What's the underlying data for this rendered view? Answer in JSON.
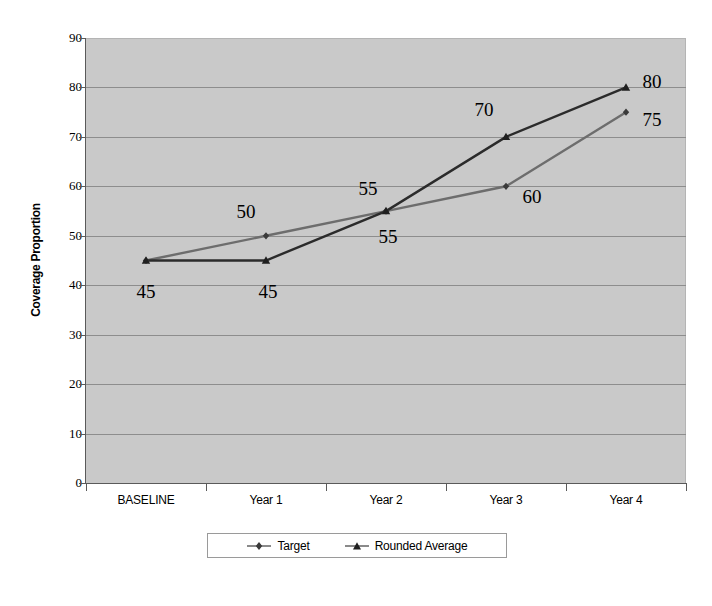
{
  "chart_data": {
    "type": "line",
    "title": "",
    "xlabel": "",
    "ylabel": "Coverage  Proportion",
    "categories": [
      "BASELINE",
      "Year 1",
      "Year 2",
      "Year 3",
      "Year 4"
    ],
    "series": [
      {
        "name": "Target",
        "color": "#6d6d6d",
        "marker": "diamond",
        "values": [
          45,
          50,
          55,
          60,
          75
        ],
        "labels": [
          "45",
          "50",
          "55",
          "60",
          "75"
        ]
      },
      {
        "name": "Rounded Average",
        "color": "#2b2b2b",
        "marker": "triangle",
        "values": [
          45,
          45,
          55,
          70,
          80
        ],
        "labels": [
          "45",
          "45",
          "55",
          "70",
          "80"
        ]
      }
    ],
    "ylim": [
      0,
      90
    ],
    "ytick_labels": [
      "90",
      "80",
      "70",
      "60",
      "50",
      "40",
      "30",
      "20",
      "10",
      "0"
    ],
    "ytick_values": [
      90,
      80,
      70,
      60,
      50,
      40,
      30,
      20,
      10,
      0
    ],
    "grid": true,
    "legend_position": "bottom",
    "plot_background": "#c9c9c9",
    "gridline_color": "#8d8d8d",
    "axis_color": "#5a5a5a",
    "annotations": [
      {
        "text": "45",
        "series": "Rounded Average",
        "category": "BASELINE",
        "value": 45
      },
      {
        "text": "45",
        "series": "Rounded Average",
        "category": "Year 1",
        "value": 45
      },
      {
        "text": "50",
        "series": "Target",
        "category": "Year 1",
        "value": 50
      },
      {
        "text": "55",
        "series": "Rounded Average",
        "category": "Year 2",
        "value": 55
      },
      {
        "text": "55",
        "series": "Target",
        "category": "Year 2",
        "value": 55
      },
      {
        "text": "70",
        "series": "Rounded Average",
        "category": "Year 3",
        "value": 70
      },
      {
        "text": "60",
        "series": "Target",
        "category": "Year 3",
        "value": 60
      },
      {
        "text": "80",
        "series": "Rounded Average",
        "category": "Year 4",
        "value": 80
      },
      {
        "text": "75",
        "series": "Target",
        "category": "Year 4",
        "value": 75
      }
    ]
  },
  "legend": {
    "entries": [
      {
        "label": "Target",
        "marker": "diamond-marker-icon"
      },
      {
        "label": "Rounded Average",
        "marker": "triangle-marker-icon"
      }
    ]
  },
  "axes": {
    "y_title": "Coverage  Proportion",
    "y_ticks": [
      "90",
      "80",
      "70",
      "60",
      "50",
      "40",
      "30",
      "20",
      "10",
      "0"
    ],
    "x_ticks": [
      "BASELINE",
      "Year 1",
      "Year 2",
      "Year 3",
      "Year 4"
    ]
  }
}
